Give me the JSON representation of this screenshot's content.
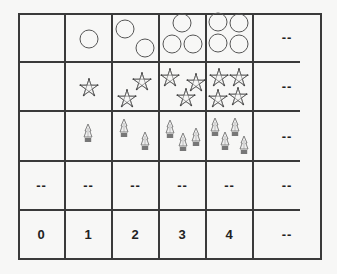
{
  "table": {
    "columns": 6,
    "rows": [
      {
        "name": "circles",
        "cells": [
          "",
          "1 circle",
          "2 circles",
          "3 circles",
          "4 circles",
          "--"
        ]
      },
      {
        "name": "stars",
        "cells": [
          "",
          "1 star",
          "2 stars",
          "3 stars",
          "4 stars",
          "--"
        ]
      },
      {
        "name": "trees",
        "cells": [
          "",
          "1 tree",
          "2 trees",
          "3 trees",
          "4 trees",
          "--"
        ]
      },
      {
        "name": "blank-row",
        "cells": [
          "--",
          "--",
          "--",
          "--",
          "--",
          "--"
        ]
      },
      {
        "name": "numbers",
        "cells": [
          "0",
          "1",
          "2",
          "3",
          "4",
          "--"
        ]
      }
    ],
    "placeholder": "--"
  },
  "icons": {
    "circle": "circle-outline-icon",
    "star": "star-outline-icon",
    "tree": "potted-tree-icon"
  },
  "colors": {
    "background": "#f7f7f6",
    "line": "#3a3a3a",
    "icon_stroke": "#555555",
    "pot": "#777777"
  }
}
